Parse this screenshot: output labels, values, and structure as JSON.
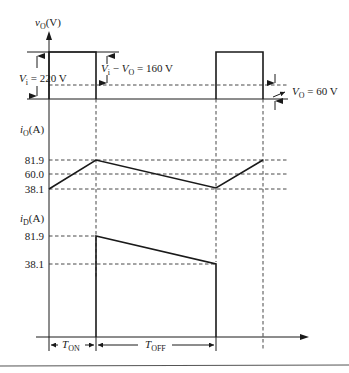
{
  "diagram": {
    "type": "waveform",
    "colors": {
      "ink": "#1a1a1a",
      "background": "#ffffff"
    },
    "vo_panel": {
      "axis_label": {
        "var": "v",
        "sub": "O",
        "unit": "(V)"
      },
      "annotations": {
        "vi": {
          "var": "V",
          "sub": "i",
          "text": " = 220 V"
        },
        "vi_minus_vo": {
          "var1": "V",
          "sub1": "i",
          "mid": " − ",
          "var2": "V",
          "sub2": "O",
          "text": " = 160 V"
        },
        "vo": {
          "var": "V",
          "sub": "O",
          "text": " = 60 V"
        }
      },
      "levels_V": {
        "high": 220,
        "low": 0,
        "average": 60
      }
    },
    "io_panel": {
      "axis_label": {
        "var": "i",
        "sub": "O",
        "unit": "(A)"
      },
      "ticks": [
        "81.9",
        "60.0",
        "38.1"
      ],
      "values_A": {
        "max": 81.9,
        "avg": 60.0,
        "min": 38.1
      }
    },
    "id_panel": {
      "axis_label": {
        "var": "i",
        "sub": "D",
        "unit": "(A)"
      },
      "ticks": [
        "81.9",
        "38.1"
      ],
      "values_A": {
        "max": 81.9,
        "min": 38.1
      }
    },
    "time_axis": {
      "t_on": {
        "var": "T",
        "sub": "ON"
      },
      "t_off": {
        "var": "T",
        "sub": "OFF"
      }
    }
  }
}
